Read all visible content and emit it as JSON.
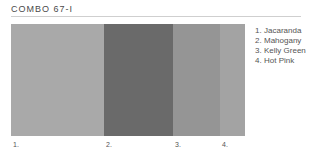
{
  "title": "COMBO 67-I",
  "swatches": [
    {
      "number": "1.",
      "name": "Jacaranda",
      "color": "#a9a9a9",
      "width": 93
    },
    {
      "number": "2.",
      "name": "Mahogany",
      "color": "#6a6a6a",
      "width": 69
    },
    {
      "number": "3.",
      "name": "Kelly Green",
      "color": "#959595",
      "width": 47
    },
    {
      "number": "4.",
      "name": "Hot Pink",
      "color": "#a3a3a3",
      "width": 25
    }
  ],
  "legend": [
    {
      "number": "1.",
      "label": "Jacaranda"
    },
    {
      "number": "2.",
      "label": "Mahogany"
    },
    {
      "number": "3.",
      "label": "Kelly Green"
    },
    {
      "number": "4.",
      "label": "Hot Pink"
    }
  ]
}
